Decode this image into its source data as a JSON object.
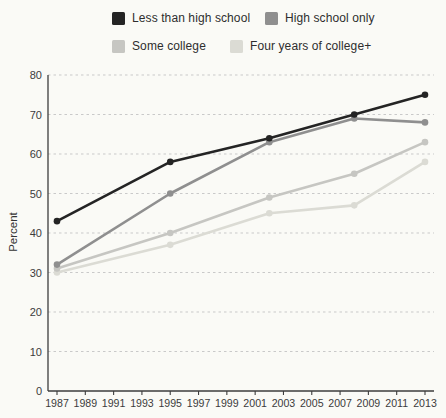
{
  "chart_data": {
    "type": "line",
    "title": "",
    "xlabel": "",
    "ylabel": "Percent",
    "x": [
      1987,
      1995,
      2002,
      2008,
      2013
    ],
    "series": [
      {
        "name": "Less than high school",
        "color": "#242424",
        "values": [
          43,
          58,
          64,
          70,
          75
        ]
      },
      {
        "name": "High school only",
        "color": "#8f8f8f",
        "values": [
          32,
          50,
          63,
          69,
          68
        ]
      },
      {
        "name": "Some college",
        "color": "#c6c6c2",
        "values": [
          31,
          40,
          49,
          55,
          63
        ]
      },
      {
        "name": "Four years of college+",
        "color": "#dbdbd4",
        "values": [
          30,
          37,
          45,
          47,
          58
        ]
      }
    ],
    "xlim": [
      1987,
      2013
    ],
    "ylim": [
      0,
      80
    ],
    "yticks": [
      0,
      10,
      20,
      30,
      40,
      50,
      60,
      70,
      80
    ],
    "xticks": [
      1987,
      1989,
      1991,
      1993,
      1995,
      1997,
      1999,
      2001,
      2003,
      2005,
      2007,
      2009,
      2011,
      2013
    ],
    "grid": "dashed-horizontal",
    "legend_position": "top",
    "colors": {
      "background": "#fafaf6",
      "gridline": "#c9c9c9",
      "axis": "#3d3d3d",
      "tick_text": "#3c3c3c"
    }
  }
}
